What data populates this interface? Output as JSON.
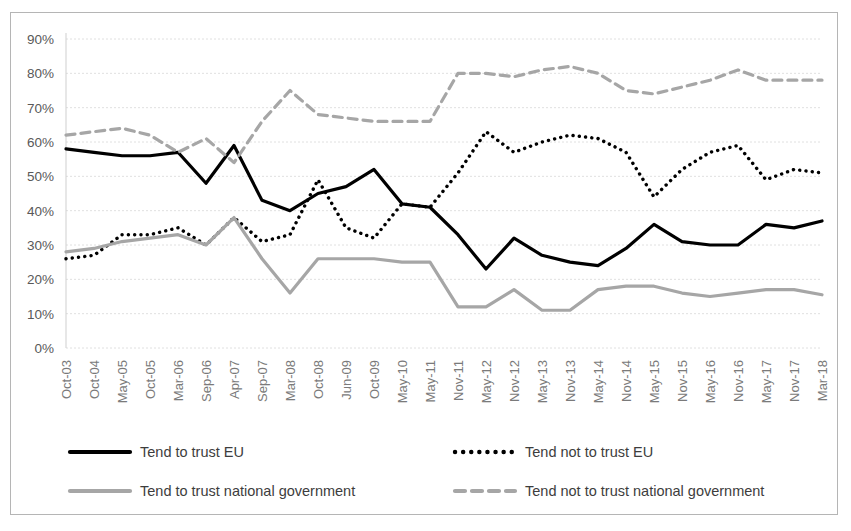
{
  "chart_data": {
    "type": "line",
    "title": "",
    "subtitle": "",
    "xlabel": "",
    "ylabel": "",
    "ylim": [
      0,
      90
    ],
    "ytick_labels": [
      "0%",
      "10%",
      "20%",
      "30%",
      "40%",
      "50%",
      "60%",
      "70%",
      "80%",
      "90%"
    ],
    "ytick_values": [
      0,
      10,
      20,
      30,
      40,
      50,
      60,
      70,
      80,
      90
    ],
    "grid": true,
    "legend_position": "bottom",
    "categories": [
      "Oct-03",
      "Oct-04",
      "May-05",
      "Oct-05",
      "Mar-06",
      "Sep-06",
      "Apr-07",
      "Sep-07",
      "Mar-08",
      "Oct-08",
      "Jun-09",
      "Oct-09",
      "May-10",
      "May-11",
      "Nov-11",
      "May-12",
      "Nov-12",
      "May-13",
      "Nov-13",
      "May-14",
      "Nov-14",
      "May-15",
      "Nov-15",
      "May-16",
      "Nov-16",
      "May-17",
      "Nov-17",
      "Mar-18"
    ],
    "series": [
      {
        "name": "Tend to trust EU",
        "style": "solid",
        "color": "#000000",
        "values": [
          58,
          57,
          56,
          56,
          57,
          48,
          59,
          43,
          40,
          45,
          47,
          52,
          42,
          41,
          33,
          23,
          32,
          27,
          25,
          24,
          29,
          36,
          31,
          30,
          30,
          36,
          35,
          37
        ]
      },
      {
        "name": "Tend not to trust EU",
        "style": "dotted",
        "color": "#000000",
        "values": [
          26,
          27,
          33,
          33,
          35,
          30,
          38,
          31,
          33,
          49,
          35,
          32,
          42,
          41,
          51,
          63,
          57,
          60,
          62,
          61,
          57,
          44,
          52,
          57,
          59,
          49,
          52,
          51
        ]
      },
      {
        "name": "Tend to trust national government",
        "style": "solid",
        "color": "#a6a6a6",
        "values": [
          28,
          29,
          31,
          32,
          33,
          30,
          38,
          26,
          16,
          26,
          26,
          26,
          25,
          25,
          12,
          12,
          17,
          11,
          11,
          17,
          18,
          18,
          16,
          15,
          16,
          17,
          17,
          15.5
        ]
      },
      {
        "name": "Tend not to trust national government",
        "style": "dashed",
        "color": "#a6a6a6",
        "values": [
          62,
          63,
          64,
          62,
          57,
          61,
          54,
          66,
          75,
          68,
          67,
          66,
          66,
          66,
          80,
          80,
          79,
          81,
          82,
          80,
          75,
          74,
          76,
          78,
          81,
          78,
          78,
          78
        ]
      }
    ]
  },
  "legend": {
    "items": [
      {
        "label": "Tend to trust EU",
        "swatch": "solid-black"
      },
      {
        "label": "Tend not to trust EU",
        "swatch": "dotted-black"
      },
      {
        "label": "Tend to trust national government",
        "swatch": "solid-grey"
      },
      {
        "label": "Tend not to trust national government",
        "swatch": "dashed-grey"
      }
    ]
  },
  "colors": {
    "series_black": "#000000",
    "series_grey": "#a6a6a6",
    "gridline": "#e0e0e0",
    "axis": "#cfcfcf",
    "border": "#b5b5b5",
    "tick_text": "#7a7a7a",
    "legend_text": "#3d3d3d"
  }
}
